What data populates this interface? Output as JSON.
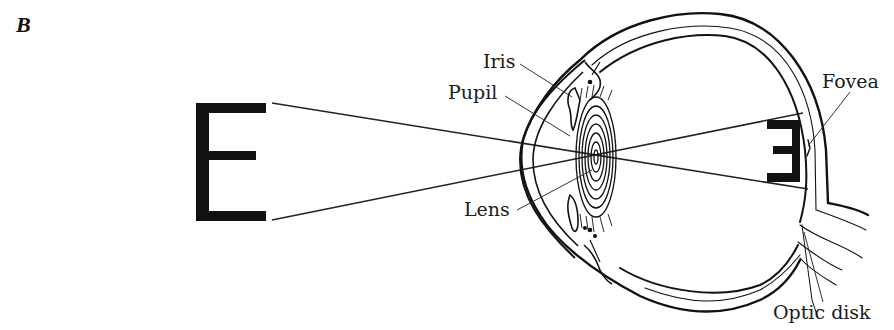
{
  "figure": {
    "panel_label": "B",
    "object_letter": "E",
    "retinal_image_letter": "E (inverted)",
    "labels": {
      "iris": "Iris",
      "pupil": "Pupil",
      "lens": "Lens",
      "fovea": "Fovea",
      "optic_disk": "Optic disk"
    },
    "colors": {
      "ink": "#111111",
      "background": "#ffffff"
    }
  }
}
